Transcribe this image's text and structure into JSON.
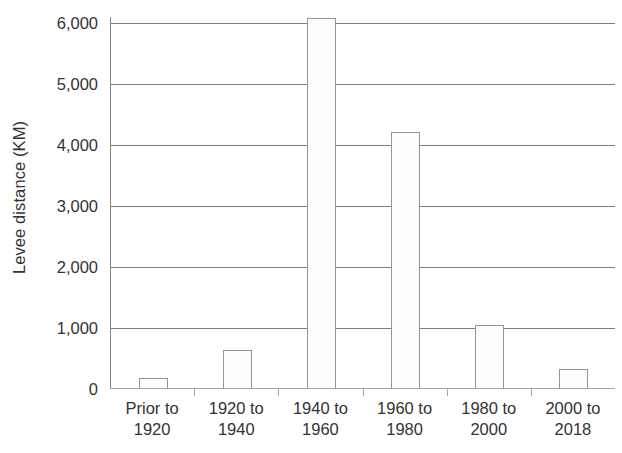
{
  "chart_data": {
    "type": "bar",
    "title": "",
    "subtitle": "",
    "xlabel": "",
    "ylabel": "Levee distance (KM)",
    "categories": [
      "Prior to 1920",
      "1920 to 1940",
      "1940 to 1960",
      "1960 to 1980",
      "1980 to 2000",
      "2000 to 2018"
    ],
    "category_lines": [
      [
        "Prior to",
        "1920"
      ],
      [
        "1920 to",
        "1940"
      ],
      [
        "1940 to",
        "1960"
      ],
      [
        "1960 to",
        "1980"
      ],
      [
        "1980 to",
        "2000"
      ],
      [
        "2000 to",
        "2018"
      ]
    ],
    "values": [
      160,
      620,
      6060,
      4200,
      1040,
      320
    ],
    "ylim": [
      0,
      6100
    ],
    "yticks": [
      0,
      1000,
      2000,
      3000,
      4000,
      5000,
      6000
    ],
    "ytick_labels": [
      "0",
      "1,000",
      "2,000",
      "3,000",
      "4,000",
      "5,000",
      "6,000"
    ],
    "grid": "horizontal",
    "legend": "none",
    "bar_fill_color": "#fdfdfd",
    "bar_border_color": "#959595",
    "gridline_color": "#7f7f7f",
    "axis_color": "#a6a6a6",
    "text_color": "#333333"
  }
}
